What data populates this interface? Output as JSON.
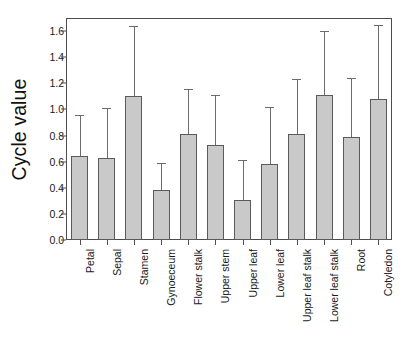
{
  "chart_data": {
    "type": "bar",
    "title": "",
    "subtitle": "",
    "xlabel": "",
    "ylabel": "Cycle value",
    "ylim": [
      0.0,
      1.7
    ],
    "yticks": [
      "0.0",
      "0.2",
      "0.4",
      "0.6",
      "0.8",
      "1.0",
      "1.2",
      "1.4",
      "1.6"
    ],
    "ytick_values": [
      0.0,
      0.2,
      0.4,
      0.6,
      0.8,
      1.0,
      1.2,
      1.4,
      1.6
    ],
    "grid": false,
    "legend": false,
    "legend_position": "none",
    "error_bars": "upper-only",
    "bar_fill_color": "#c9c9c9",
    "bar_edge_color": "#5a5a5a",
    "error_bar_color": "#6b6b6b",
    "axis_color": "#4d4d4d",
    "categories": [
      "Petal",
      "Sepal",
      "Stamen",
      "Gynoeceum",
      "Flower stalk",
      "Upper stem",
      "Upper leaf",
      "Lower leaf",
      "Upper leaf stalk",
      "Lower leaf stalk",
      "Root",
      "Cotyledon"
    ],
    "values": [
      0.64,
      0.63,
      1.1,
      0.38,
      0.81,
      0.73,
      0.31,
      0.58,
      0.81,
      1.11,
      0.79,
      1.08
    ],
    "error_upper": [
      0.96,
      1.01,
      1.64,
      0.59,
      1.16,
      1.11,
      0.61,
      1.02,
      1.23,
      1.6,
      1.24,
      1.65
    ]
  }
}
